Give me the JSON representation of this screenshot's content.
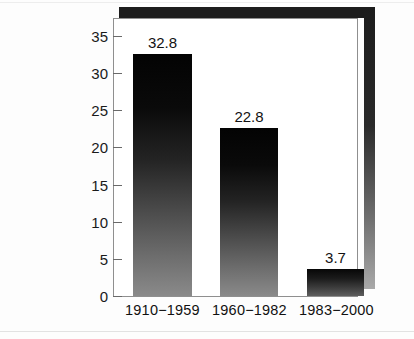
{
  "chart_data": {
    "type": "bar",
    "title": "",
    "subtitle": "",
    "xlabel": "",
    "ylabel": "",
    "categories": [
      "1910−1959",
      "1960−1982",
      "1983−2000"
    ],
    "values": [
      32.8,
      22.8,
      3.7
    ],
    "value_labels": [
      "32.8",
      "22.8",
      "3.7"
    ],
    "ylim": [
      0,
      37.5
    ],
    "yticks": [
      0,
      5,
      10,
      15,
      20,
      25,
      30,
      35
    ],
    "ytick_labels": [
      "0",
      "5",
      "10",
      "15",
      "20",
      "25",
      "30",
      "35"
    ],
    "grid": false,
    "legend": null,
    "legend_position": "none",
    "series": [
      {
        "name": "",
        "values": [
          32.8,
          22.8,
          3.7
        ]
      }
    ],
    "colors": {
      "bar_top": "#030303",
      "bar_bottom": "#8a8a8a",
      "axis": "#8f8f8f",
      "tick": "#6a6a6a",
      "text": "#121212",
      "shadow": "#1c1c1c",
      "background": "#ffffff"
    },
    "style": {
      "bar_fill": "vertical-gradient-black-to-gray",
      "frame": "box-with-drop-shadow",
      "tick_direction": "out"
    }
  }
}
